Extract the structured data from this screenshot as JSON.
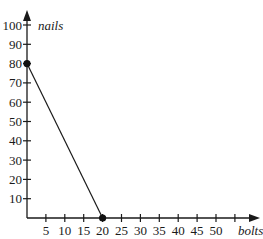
{
  "chart_data": {
    "type": "line",
    "title": "",
    "xlabel": "bolts",
    "ylabel": "nails",
    "xlim": [
      0,
      60
    ],
    "ylim": [
      0,
      105
    ],
    "x_ticks": [
      5,
      10,
      15,
      20,
      25,
      30,
      35,
      40,
      45,
      50,
      55
    ],
    "x_tick_labels": [
      "5",
      "10",
      "15",
      "20",
      "25",
      "30",
      "35",
      "40",
      "45",
      "50",
      ""
    ],
    "y_ticks": [
      10,
      20,
      30,
      40,
      50,
      60,
      70,
      80,
      90,
      100
    ],
    "y_tick_labels": [
      "10",
      "20",
      "30",
      "40",
      "50",
      "60",
      "70",
      "80",
      "90",
      "100"
    ],
    "grid": false,
    "legend": null,
    "series": [
      {
        "name": "budget line",
        "x": [
          0,
          20
        ],
        "y": [
          80,
          0
        ],
        "markers": true
      }
    ],
    "points": [
      {
        "x": 0,
        "y": 80
      },
      {
        "x": 20,
        "y": 0
      }
    ]
  }
}
